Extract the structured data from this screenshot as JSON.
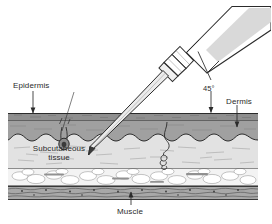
{
  "figure": {
    "type": "anatomical-cross-section"
  },
  "labels": {
    "epidermis": "Epidermis",
    "dermis": "Dermis",
    "subcutaneous_line1": "Subcutaneous",
    "subcutaneous_line2": "tissue",
    "muscle": "Muscle",
    "angle": "45°"
  },
  "colors": {
    "ink": "#2b2b2b",
    "epidermis_band": "#8a8a8a",
    "dermis_fill": "#9a9a9a",
    "subcutaneous_fill": "#dedede",
    "fat_fill": "#f1f1f1",
    "muscle_fill": "#b3b3b3",
    "syringe_fill": "#ffffff",
    "plunger_fill": "#d8d8d8",
    "needle_fill": "#e8e8e8",
    "background": "#ffffff"
  },
  "elements": {
    "syringe_barrel": "syringe-barrel",
    "syringe_plunger": "syringe-plunger",
    "syringe_hub": "syringe-hub",
    "needle": "needle",
    "needle_bevel": "needle-bevel",
    "sweat_gland": "sweat-gland",
    "hair_follicle": "hair-follicle"
  },
  "layers": [
    {
      "name": "Epidermis",
      "order": 1
    },
    {
      "name": "Dermis",
      "order": 2
    },
    {
      "name": "Subcutaneous tissue",
      "order": 3
    },
    {
      "name": "Muscle",
      "order": 4
    }
  ]
}
